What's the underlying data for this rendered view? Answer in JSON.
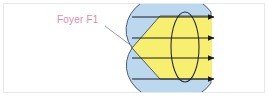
{
  "figure": {
    "name": "lens-focal-point-diagram",
    "label_foyer": "Foyer F1",
    "colors": {
      "beam_yellow": "#f7ef70",
      "lens_blue": "#bcd8ef",
      "outline": "#2b2b3c",
      "label_pink": "#e48aa8",
      "frame_border": "#b5b7b9",
      "background": "#ffffff",
      "ray_black": "#1a1a1a"
    },
    "geometry": {
      "focal_point": {
        "x": 132,
        "y": 48
      },
      "leader_line": {
        "x1": 105,
        "y1": 26,
        "x2": 132,
        "y2": 46
      },
      "lens_ellipse": {
        "cx": 185,
        "cy": 47,
        "rx": 14,
        "ry": 35
      },
      "blue_envelope": {
        "cx": 166,
        "cy": 47,
        "rx": 45,
        "ry": 37
      },
      "beam_right_edge_x": 212,
      "beam_top_y": 16,
      "beam_bottom_y": 79
    },
    "rays": [
      {
        "name": "ray-1",
        "y": 17,
        "x_start": 132,
        "x_end": 216
      },
      {
        "name": "ray-2",
        "y": 38,
        "x_start": 132,
        "x_end": 216
      },
      {
        "name": "ray-3",
        "y": 58,
        "x_start": 132,
        "x_end": 216
      },
      {
        "name": "ray-4",
        "y": 79,
        "x_start": 132,
        "x_end": 216
      }
    ],
    "ray_count": 4
  }
}
